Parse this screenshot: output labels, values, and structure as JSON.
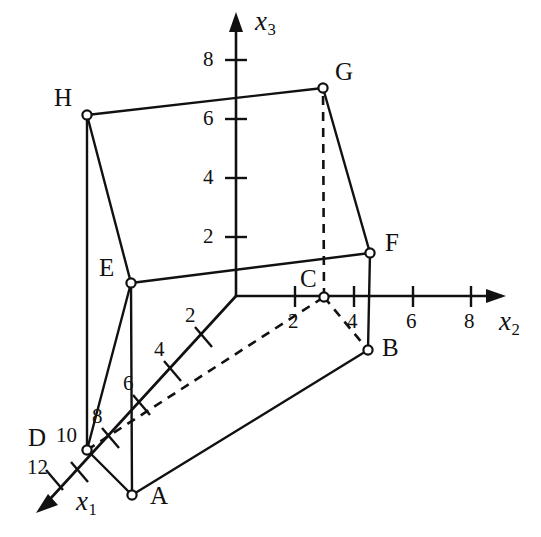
{
  "figure": {
    "kind": "3d-coordinate-axes-solid",
    "background_color": "#ffffff",
    "line_color": "#111111",
    "axes": [
      {
        "id": "x1",
        "label": "x",
        "subscript": "1",
        "direction": "down-left",
        "ticks": [
          2,
          4,
          6,
          8,
          10,
          12
        ]
      },
      {
        "id": "x2",
        "label": "x",
        "subscript": "2",
        "direction": "right",
        "ticks": [
          2,
          4,
          6,
          8
        ]
      },
      {
        "id": "x3",
        "label": "x",
        "subscript": "3",
        "direction": "up",
        "ticks": [
          2,
          4,
          6,
          8
        ]
      }
    ],
    "axis_labels": {
      "x1": "x",
      "x1_sub": "1",
      "x2": "x",
      "x2_sub": "2",
      "x3": "x",
      "x3_sub": "3"
    },
    "tick_labels": {
      "x1": [
        "2",
        "4",
        "6",
        "8",
        "10",
        "12"
      ],
      "x2": [
        "2",
        "4",
        "6",
        "8"
      ],
      "x3": [
        "2",
        "4",
        "6",
        "8"
      ]
    },
    "vertices": [
      {
        "name": "A",
        "x": 132,
        "y": 495,
        "label_dx": 18,
        "label_dy": -6,
        "hidden": false
      },
      {
        "name": "B",
        "x": 368,
        "y": 350,
        "label_dx": 14,
        "label_dy": -9,
        "hidden": false
      },
      {
        "name": "C",
        "x": 324,
        "y": 297,
        "label_dx": -13,
        "label_dy": -35,
        "hidden": true
      },
      {
        "name": "D",
        "x": 87,
        "y": 450,
        "label_dx": -43,
        "label_dy": -29,
        "hidden": false
      },
      {
        "name": "E",
        "x": 131,
        "y": 283,
        "label_dx": -32,
        "label_dy": -32,
        "hidden": false
      },
      {
        "name": "F",
        "x": 370,
        "y": 253,
        "label_dx": 15,
        "label_dy": -26,
        "hidden": false
      },
      {
        "name": "G",
        "x": 323,
        "y": 88,
        "label_dx": 12,
        "label_dy": -32,
        "hidden": false
      },
      {
        "name": "H",
        "x": 87,
        "y": 115,
        "label_dx": -33,
        "label_dy": -32,
        "hidden": false
      }
    ],
    "edges_solid": [
      [
        "A",
        "B"
      ],
      [
        "A",
        "D"
      ],
      [
        "A",
        "E"
      ],
      [
        "B",
        "F"
      ],
      [
        "D",
        "E"
      ],
      [
        "D",
        "H"
      ],
      [
        "E",
        "F"
      ],
      [
        "E",
        "H"
      ],
      [
        "F",
        "G"
      ],
      [
        "G",
        "H"
      ]
    ],
    "edges_dashed": [
      [
        "D",
        "C"
      ],
      [
        "C",
        "B"
      ],
      [
        "C",
        "G"
      ]
    ],
    "origin": {
      "x": 236,
      "y": 296
    }
  }
}
